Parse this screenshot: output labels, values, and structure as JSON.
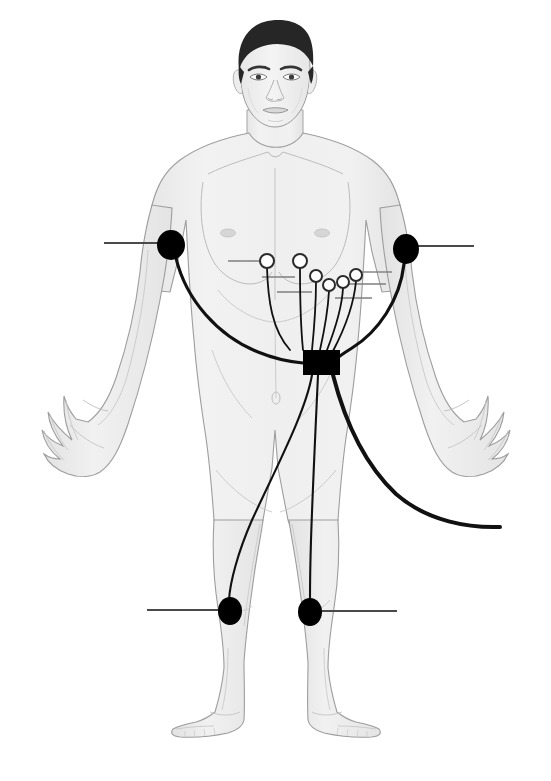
{
  "page": {
    "caption_fragment": "",
    "background_color": "#ffffff"
  },
  "figure": {
    "width": 551,
    "height": 781
  },
  "palette": {
    "skin_fill": "#eeeeee",
    "skin_fill_light": "#f4f4f4",
    "skin_fill_shadow": "#e4e4e4",
    "outline": "#9a9a9a",
    "outline_soft": "#bcbcbc",
    "hair": "#262626",
    "electrode_limb": "#000000",
    "electrode_chest_fill": "#ffffff",
    "electrode_chest_stroke": "#2a2a2a",
    "cable": "#111111",
    "leader_line": "#7f7f7f",
    "monitor_box": "#000000",
    "background": "#ffffff"
  },
  "monitor": {
    "name": "holter-recorder-box",
    "x": 303,
    "y": 350,
    "width": 37,
    "height": 25,
    "label": ""
  },
  "limb_electrodes": [
    {
      "id": "RA",
      "name": "right-arm-electrode",
      "description": "Right arm limb electrode",
      "cx": 171,
      "cy": 245,
      "rx": 14,
      "ry": 15,
      "leader": {
        "x1": 104,
        "y1": 243,
        "x2": 165,
        "y2": 243
      }
    },
    {
      "id": "LA",
      "name": "left-arm-electrode",
      "description": "Left arm limb electrode",
      "cx": 406,
      "cy": 249,
      "rx": 13,
      "ry": 15,
      "leader": {
        "x1": 418,
        "y1": 246,
        "x2": 474,
        "y2": 246
      }
    },
    {
      "id": "RL",
      "name": "right-leg-electrode",
      "description": "Right leg limb electrode",
      "cx": 230,
      "cy": 611,
      "rx": 12,
      "ry": 14,
      "leader": {
        "x1": 147,
        "y1": 610,
        "x2": 222,
        "y2": 610
      }
    },
    {
      "id": "LL",
      "name": "left-leg-electrode",
      "description": "Left leg limb electrode",
      "cx": 310,
      "cy": 612,
      "rx": 12,
      "ry": 14,
      "leader": {
        "x1": 318,
        "y1": 611,
        "x2": 397,
        "y2": 611
      }
    }
  ],
  "chest_electrodes": [
    {
      "id": "V1",
      "name": "chest-electrode-v1",
      "cx": 267,
      "cy": 261,
      "r": 7,
      "leader": {
        "x1": 228,
        "y1": 261,
        "x2": 260,
        "y2": 261
      }
    },
    {
      "id": "V2",
      "name": "chest-electrode-v2",
      "cx": 300,
      "cy": 261,
      "r": 7,
      "leader": {
        "x1": 261,
        "y1": 261,
        "x2": 293,
        "y2": 261
      }
    },
    {
      "id": "V3",
      "name": "chest-electrode-v3",
      "cx": 316,
      "cy": 276,
      "r": 6,
      "leader": {
        "x1": 277,
        "y1": 276,
        "x2": 310,
        "y2": 276
      }
    },
    {
      "id": "V4",
      "name": "chest-electrode-v4",
      "cx": 329,
      "cy": 285,
      "r": 6,
      "leader": {
        "x1": 290,
        "y1": 285,
        "x2": 323,
        "y2": 285
      }
    },
    {
      "id": "V5",
      "name": "chest-electrode-v5",
      "cx": 343,
      "cy": 282,
      "r": 6,
      "leader": {
        "x1": 349,
        "y1": 282,
        "x2": 382,
        "y2": 282
      }
    },
    {
      "id": "V6",
      "name": "chest-electrode-v6",
      "cx": 356,
      "cy": 275,
      "r": 6,
      "leader": {
        "x1": 362,
        "y1": 275,
        "x2": 390,
        "y2": 275
      }
    }
  ],
  "cables": {
    "trunk_cable_name": "recorder-output-cable",
    "count_to_box": 9
  }
}
